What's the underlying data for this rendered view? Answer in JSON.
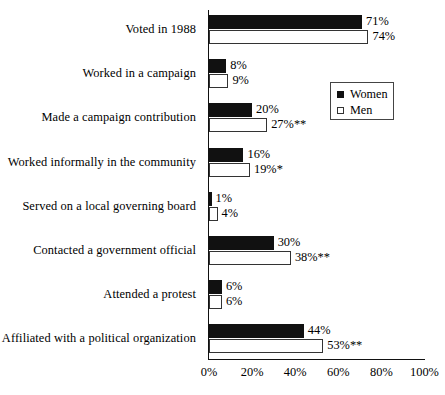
{
  "chart_data": {
    "type": "bar",
    "orientation": "horizontal",
    "title": "",
    "xlabel": "",
    "ylabel": "",
    "xlim": [
      0,
      100
    ],
    "grid": false,
    "legend_position": "top-right",
    "categories": [
      "Voted in 1988",
      "Worked in a campaign",
      "Made a campaign contribution",
      "Worked informally in the community",
      "Served on a local governing board",
      "Contacted a government official",
      "Attended a protest",
      "Affiliated with a political organization"
    ],
    "series": [
      {
        "name": "Women",
        "values": [
          71,
          8,
          20,
          16,
          1,
          30,
          6,
          44
        ]
      },
      {
        "name": "Men",
        "values": [
          74,
          9,
          27,
          19,
          4,
          38,
          6,
          53
        ]
      }
    ],
    "value_labels": {
      "women": [
        "71%",
        "8%",
        "20%",
        "16%",
        "1%",
        "30%",
        "6%",
        "44%"
      ],
      "men": [
        "74%",
        "9%",
        "27%**",
        "19%*",
        "4%",
        "38%**",
        "6%",
        "53%**"
      ]
    },
    "tick_labels": [
      "0%",
      "20%",
      "40%",
      "60%",
      "80%",
      "100%"
    ],
    "tick_values": [
      0,
      20,
      40,
      60,
      80,
      100
    ],
    "significance_notes": {
      "single_star": "*",
      "double_star": "**"
    }
  },
  "legend": {
    "items": [
      {
        "label": "Women",
        "swatch": "filled-square-black"
      },
      {
        "label": "Men",
        "swatch": "open-square-white"
      }
    ]
  }
}
